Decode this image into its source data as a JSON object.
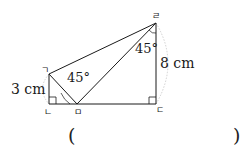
{
  "diagram": {
    "vertices": {
      "top_left": "ㄱ",
      "bottom_left": "ㄴ",
      "bottom_middle": "ㅁ",
      "bottom_right": "ㄷ",
      "top_right": "ㄹ"
    },
    "angles": {
      "at_bottom_middle": "45°",
      "at_top_right": "45°"
    },
    "lengths": {
      "left_side": "3 cm",
      "right_side": "8 cm"
    }
  },
  "answer": {
    "open_paren": "(",
    "close_paren": ")",
    "value": ""
  },
  "colors": {
    "line": "#1a1a1a",
    "arc": "#bdbdbd"
  }
}
